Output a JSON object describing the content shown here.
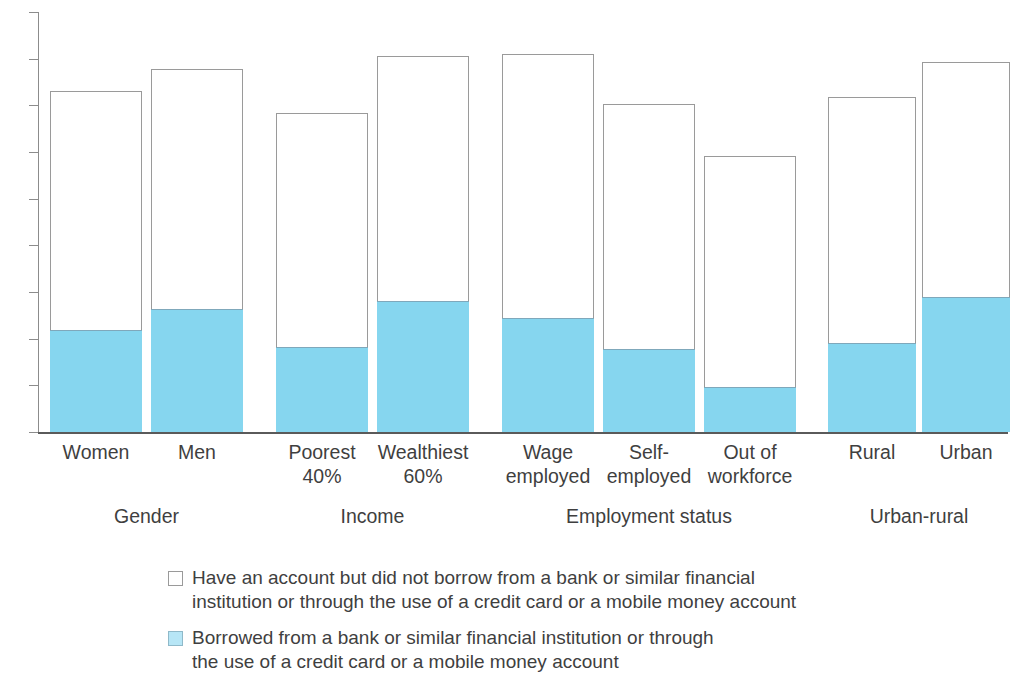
{
  "chart_data": {
    "type": "bar",
    "stacked": true,
    "title": "",
    "subtitle": "",
    "xlabel": "",
    "ylabel": "",
    "ylim": [
      0,
      90
    ],
    "yticks": [
      0,
      10,
      20,
      30,
      40,
      50,
      60,
      70,
      80,
      90
    ],
    "ytick_labels": [
      "0",
      "10",
      "20",
      "30",
      "40",
      "50",
      "60",
      "70",
      "80",
      "90"
    ],
    "grid": false,
    "legend_position": "bottom",
    "categories": [
      "Women",
      "Men",
      "Poorest\n40%",
      "Wealthiest\n60%",
      "Wage\nemployed",
      "Self-\nemployed",
      "Out of\nworkforce",
      "Rural",
      "Urban"
    ],
    "groups": [
      {
        "label": "Gender",
        "categories": [
          "Women",
          "Men"
        ]
      },
      {
        "label": "Income",
        "categories": [
          "Poorest 40%",
          "Wealthiest 60%"
        ]
      },
      {
        "label": "Employment status",
        "categories": [
          "Wage employed",
          "Self-employed",
          "Out of workforce"
        ]
      },
      {
        "label": "Urban-rural",
        "categories": [
          "Rural",
          "Urban"
        ]
      }
    ],
    "series": [
      {
        "name": "Borrowed from a bank or similar financial institution or through the use of a credit card or a mobile money account",
        "color": "#86d6ef",
        "values": [
          21.8,
          26.4,
          18.3,
          28.1,
          24.4,
          17.8,
          9.6,
          19.1,
          29.0
        ]
      },
      {
        "name": "Have an account but did not borrow from a bank or similar financial institution or through the use of a credit card or a mobile money account",
        "color": "#ffffff",
        "values": [
          51.2,
          51.4,
          50.1,
          52.4,
          56.5,
          52.5,
          49.6,
          52.6,
          50.3
        ]
      }
    ],
    "totals": [
      73.0,
      77.8,
      68.4,
      80.5,
      80.9,
      70.3,
      59.2,
      71.7,
      79.3
    ],
    "legend": [
      {
        "swatch": "white",
        "label": "Have an account but did not borrow from a bank or similar financial\ninstitution or through the use of a credit card or a mobile money account"
      },
      {
        "swatch": "blue",
        "label": "Borrowed from a bank or similar financial institution or through\nthe use of a credit card or a mobile money account"
      }
    ]
  },
  "colors": {
    "blue_fill": "#86d6ef",
    "blue_legend": "#b7e6f6",
    "bar_outline": "#9a9a9a",
    "axis": "#8c8c8c",
    "text": "#3f3f3f"
  }
}
